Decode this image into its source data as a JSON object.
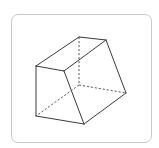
{
  "figure": {
    "frame": {
      "border_color": "#c9c9c9",
      "background": "#ffffff"
    },
    "colors": {
      "visible_edge": "#3a3a3a",
      "hidden_edge": "#4a4a4a"
    },
    "vertices": {
      "A": [
        36,
        66
      ],
      "B": [
        64,
        71
      ],
      "C": [
        84,
        124
      ],
      "D": [
        36,
        116
      ],
      "E": [
        79,
        37
      ],
      "F": [
        106,
        40
      ],
      "G": [
        126,
        93
      ],
      "H": [
        79,
        85
      ]
    },
    "visible_edges": [
      [
        "A",
        "B"
      ],
      [
        "B",
        "C"
      ],
      [
        "C",
        "D"
      ],
      [
        "D",
        "A"
      ],
      [
        "A",
        "E"
      ],
      [
        "E",
        "F"
      ],
      [
        "B",
        "F"
      ],
      [
        "F",
        "G"
      ],
      [
        "C",
        "G"
      ]
    ],
    "hidden_edges": [
      [
        "E",
        "H"
      ],
      [
        "H",
        "D"
      ],
      [
        "H",
        "G"
      ]
    ]
  }
}
